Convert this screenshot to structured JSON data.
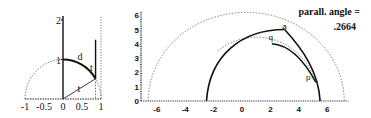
{
  "chart_data": [
    {
      "type": "line",
      "title": "",
      "xlabel": "",
      "ylabel": "",
      "xlim": [
        -1,
        1
      ],
      "ylim": [
        0,
        2
      ],
      "x_ticks": [
        "-1",
        "-0.5",
        "0",
        "0.5",
        "1"
      ],
      "x_tick_values": [
        -1,
        -0.5,
        0,
        0.5,
        1
      ],
      "y_ticks": [
        "1",
        "2"
      ],
      "y_tick_values": [
        1,
        2
      ],
      "grid": false,
      "series": [
        {
          "name": "unit semicircle",
          "style": "dashed",
          "shape": "circle",
          "center": [
            0,
            0
          ],
          "radius": 1
        },
        {
          "name": "arc d",
          "style": "solid",
          "shape": "arc",
          "center": [
            0,
            0
          ],
          "radius": 1,
          "from_angle_deg": 90,
          "to_angle_deg": 31
        },
        {
          "name": "radius segment",
          "style": "solid",
          "points": [
            [
              0,
              0
            ],
            [
              0.857,
              0.515
            ]
          ]
        },
        {
          "name": "vertical ray",
          "style": "solid",
          "points": [
            [
              0.857,
              0.515
            ],
            [
              0.857,
              1.5
            ]
          ]
        },
        {
          "name": "drop to axis",
          "style": "dashed",
          "points": [
            [
              0.857,
              0.515
            ],
            [
              0.857,
              0
            ]
          ]
        },
        {
          "name": "vertical asymptote x=1",
          "style": "dotted",
          "points": [
            [
              1,
              0
            ],
            [
              1,
              2
            ]
          ]
        },
        {
          "name": "y axis",
          "style": "solid",
          "points": [
            [
              0,
              0
            ],
            [
              0,
              2
            ]
          ]
        }
      ],
      "annotations": [
        {
          "text": "d",
          "at": [
            0.45,
            1.0
          ]
        },
        {
          "text": "t",
          "at": [
            0.75,
            0.72
          ]
        },
        {
          "text": "t",
          "at": [
            0.42,
            0.17
          ]
        }
      ]
    },
    {
      "type": "line",
      "title": "",
      "xlabel": "",
      "ylabel": "",
      "xlim": [
        -7,
        7.5
      ],
      "ylim": [
        0,
        6.2
      ],
      "x_ticks": [
        "-6",
        "-4",
        "-2",
        "0",
        "2",
        "4",
        "6"
      ],
      "x_tick_values": [
        -6,
        -4,
        -2,
        0,
        2,
        4,
        6
      ],
      "y_ticks": [
        "0",
        "1",
        "2",
        "3",
        "4",
        "5",
        "6"
      ],
      "y_tick_values": [
        0,
        1,
        2,
        3,
        4,
        5,
        6
      ],
      "grid": false,
      "series": [
        {
          "name": "outer circle",
          "style": "dashed",
          "shape": "circle",
          "center": [
            0.3,
            0
          ],
          "radius": 6.9
        },
        {
          "name": "inner circle",
          "style": "dashed",
          "shape": "circle",
          "center": [
            1.6,
            0
          ],
          "radius": 4.3
        },
        {
          "name": "geodesic arc",
          "style": "solid",
          "shape": "arc",
          "center": [
            1.5,
            0
          ],
          "radius": 4.0,
          "from_x": -2.5,
          "to_point": "a"
        },
        {
          "name": "segment a-ground",
          "style": "solid",
          "points_ref": [
            "a",
            [
              5.5,
              0
            ]
          ]
        },
        {
          "name": "curve q-p",
          "style": "solid",
          "points_ref": [
            "q",
            "p"
          ]
        }
      ],
      "points": {
        "a": [
          3.0,
          5.0
        ],
        "q": [
          2.1,
          4.3
        ],
        "p": [
          4.8,
          1.7
        ]
      },
      "annotations": [
        {
          "text": "a",
          "ref": "a"
        },
        {
          "text": "q",
          "ref": "q"
        },
        {
          "text": "p",
          "ref": "p"
        },
        {
          "text": "parall. angle =",
          "position": "top-right"
        },
        {
          "text": ".2664",
          "position": "top-right"
        }
      ]
    }
  ]
}
